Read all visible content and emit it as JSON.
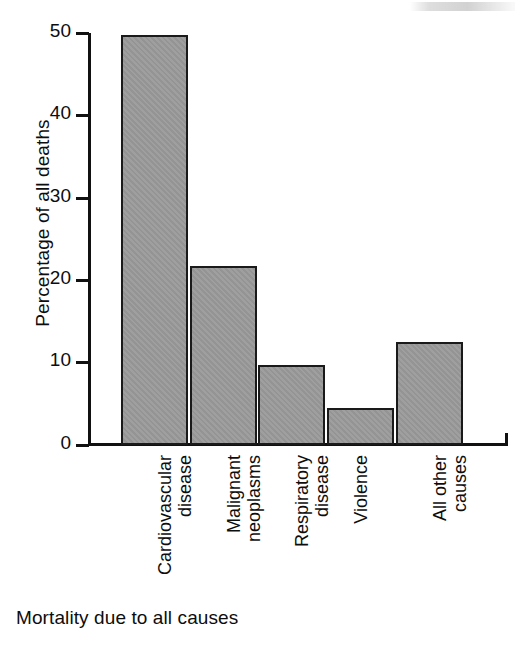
{
  "chart_data": {
    "type": "bar",
    "title": "",
    "caption": "Mortality due to all causes",
    "xlabel": "",
    "ylabel": "Percentage of all deaths",
    "ylim": [
      0,
      50
    ],
    "yticks": [
      0,
      10,
      20,
      30,
      40,
      50
    ],
    "ytick_labels": [
      "0",
      "10",
      "20",
      "30",
      "40",
      "50"
    ],
    "grid": false,
    "legend": "none",
    "orientation": "vertical",
    "categories": [
      "Cardiovascular disease",
      "Malignant neoplasms",
      "Respiratory disease",
      "Violence",
      "All other causes"
    ],
    "category_label_lines": [
      "Cardiovascular\ndisease",
      "Malignant\nneoplasms",
      "Respiratory\ndisease",
      "Violence",
      "All other\ncauses"
    ],
    "values": [
      49.8,
      21.7,
      9.7,
      4.5,
      12.5
    ],
    "colors": {
      "bar_fill": "#9a9a9a",
      "bar_border": "#1a1a1a",
      "axis": "#111111",
      "text": "#0d0d0d",
      "background": "#ffffff"
    }
  },
  "figure": {
    "y_axis_title": "Percentage of all deaths",
    "bottom_caption": "Mortality due to all causes"
  }
}
